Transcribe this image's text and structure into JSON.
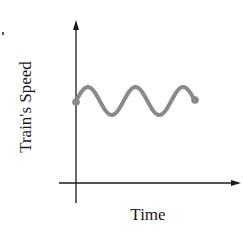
{
  "chart_data": {
    "type": "line",
    "title": "",
    "xlabel": "Time",
    "ylabel": "Train's Speed",
    "x_ticks": [],
    "y_ticks": [],
    "grid": false,
    "legend": null,
    "series": [
      {
        "name": "Train's Speed",
        "color": "#8a8a8a",
        "shape": "sinusoid",
        "cycles": 2.5,
        "start_point": {
          "x": 0,
          "y": 0.55
        },
        "end_point": {
          "x": 1.0,
          "y": 0.56
        },
        "baseline": 0.55,
        "amplitude": 0.08,
        "x": [
          0,
          0.1,
          0.2,
          0.3,
          0.4,
          0.5,
          0.6,
          0.7,
          0.8,
          0.9,
          1.0
        ],
        "values": [
          0.55,
          0.63,
          0.55,
          0.47,
          0.55,
          0.63,
          0.55,
          0.47,
          0.55,
          0.63,
          0.56
        ]
      }
    ],
    "xlim": [
      0,
      1
    ],
    "ylim": [
      0,
      1
    ]
  },
  "colors": {
    "axis": "#1a1a1a",
    "curve": "#8a8a8a",
    "background": "#ffffff"
  }
}
